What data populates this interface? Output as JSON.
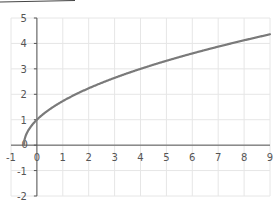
{
  "chart_data": {
    "type": "line",
    "title": "",
    "xlabel": "",
    "ylabel": "",
    "xlim": [
      -1,
      9
    ],
    "ylim": [
      -2,
      5
    ],
    "grid": true,
    "legend": null,
    "x_ticks": [
      "-1",
      "0",
      "1",
      "2",
      "3",
      "4",
      "5",
      "6",
      "7",
      "8",
      "9"
    ],
    "y_ticks": [
      "-2",
      "-1",
      "0",
      "1",
      "2",
      "3",
      "4",
      "5"
    ],
    "series": [
      {
        "name": "y = sqrt(2x+1)",
        "color": "#7a7a7a",
        "x": [
          -0.5,
          -0.4,
          -0.25,
          0,
          0.5,
          1,
          2,
          3,
          4,
          5,
          6,
          7,
          8,
          9
        ],
        "y": [
          0,
          0.45,
          0.71,
          1.0,
          1.41,
          1.73,
          2.24,
          2.65,
          3.0,
          3.32,
          3.61,
          3.87,
          4.12,
          4.36
        ]
      }
    ]
  },
  "colors": {
    "grid": "#e6e6e6",
    "axis": "#555555",
    "line": "#7a7a7a"
  }
}
